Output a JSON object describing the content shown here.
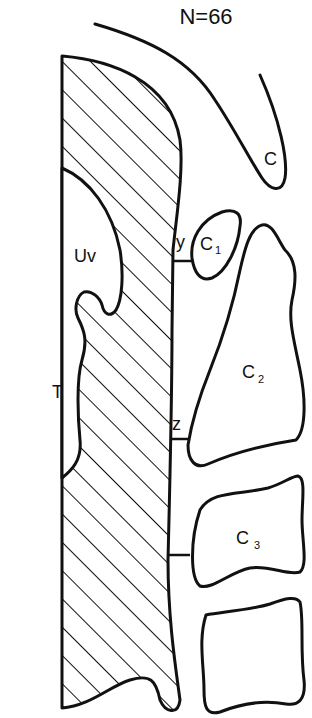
{
  "figure": {
    "title": "N=66",
    "labels": {
      "c": "C",
      "c1": "C",
      "c1_sub": "1",
      "c2": "C",
      "c2_sub": "2",
      "c3": "C",
      "c3_sub": "3",
      "uvula": "Uv",
      "tongue": "T",
      "point_y": "y",
      "point_z": "z"
    },
    "colors": {
      "line": "#111111",
      "background": "#ffffff"
    }
  }
}
